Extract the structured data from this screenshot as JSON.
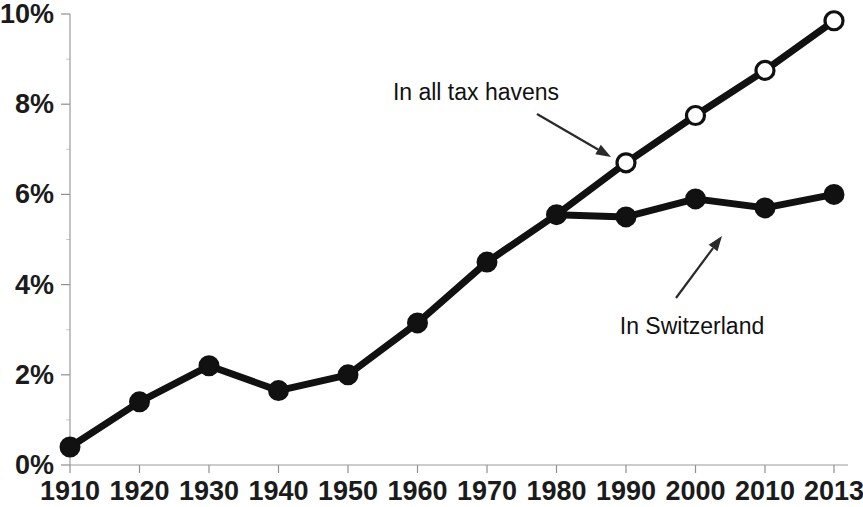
{
  "chart_data": {
    "type": "line",
    "title": "",
    "subtitle": "",
    "xlabel": "",
    "ylabel": "",
    "x": [
      1910,
      1920,
      1930,
      1940,
      1950,
      1960,
      1970,
      1980,
      1990,
      2000,
      2010,
      2013
    ],
    "categories": [
      "1910",
      "1920",
      "1930",
      "1940",
      "1950",
      "1960",
      "1970",
      "1980",
      "1990",
      "2000",
      "2010",
      "2013"
    ],
    "xtick_labels": [
      "1910",
      "1920",
      "1930",
      "1940",
      "1950",
      "1960",
      "1970",
      "1980",
      "1990",
      "2000",
      "2010",
      "2013"
    ],
    "ytick_labels": [
      "0%",
      "2%",
      "4%",
      "6%",
      "8%",
      "10%"
    ],
    "ytick_values": [
      0,
      2,
      4,
      6,
      8,
      10
    ],
    "ylim": [
      0,
      10
    ],
    "xlim": [
      1910,
      2013
    ],
    "grid": false,
    "legend": "annotations",
    "units": "percent",
    "series": [
      {
        "name": "In Switzerland",
        "marker": "filled-circle",
        "color": "#111111",
        "x": [
          1910,
          1920,
          1930,
          1940,
          1950,
          1960,
          1970,
          1980,
          1990,
          2000,
          2010,
          2013
        ],
        "values": [
          0.4,
          1.4,
          2.2,
          1.65,
          2.0,
          3.15,
          4.5,
          5.55,
          5.5,
          5.9,
          5.7,
          6.0
        ]
      },
      {
        "name": "In all tax havens",
        "marker": "open-circle",
        "color": "#111111",
        "x": [
          1980,
          1990,
          2000,
          2010,
          2013
        ],
        "values": [
          5.55,
          6.7,
          7.75,
          8.75,
          9.85
        ]
      }
    ],
    "annotations": [
      {
        "id": "tax-havens",
        "text": "In all tax havens",
        "text_x": 476,
        "text_y": 100,
        "arrow_from_x": 537,
        "arrow_from_y": 114,
        "arrow_to_x": 611,
        "arrow_to_y": 157
      },
      {
        "id": "switzerland",
        "text": "In Switzerland",
        "text_x": 692,
        "text_y": 334,
        "arrow_from_x": 676,
        "arrow_from_y": 298,
        "arrow_to_x": 722,
        "arrow_to_y": 236
      }
    ]
  },
  "colors": {
    "line": "#111111",
    "open_marker_fill": "#ffffff",
    "axis": "#9a9a9a",
    "text": "#1a1a1a",
    "background": "#ffffff"
  }
}
